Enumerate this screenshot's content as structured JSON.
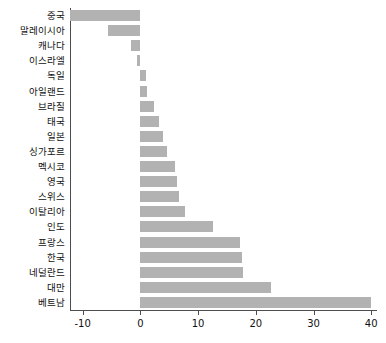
{
  "chart_data": {
    "type": "bar",
    "orientation": "horizontal",
    "title": "",
    "xlabel": "",
    "ylabel": "",
    "xlim": [
      -12.2,
      41.0
    ],
    "ylim": null,
    "grid": false,
    "legend": null,
    "bar_color": "#b2b2b2",
    "axis_color": "#4d4d4d",
    "xticks": [
      -10,
      0,
      10,
      20,
      30,
      40
    ],
    "xtick_labels": [
      "-10",
      "0",
      "10",
      "20",
      "30",
      "40"
    ],
    "categories": [
      "중국",
      "말레이시아",
      "캐나다",
      "이스라엘",
      "독일",
      "아일랜드",
      "브라질",
      "태국",
      "일본",
      "싱가포르",
      "멕시코",
      "영국",
      "스위스",
      "이탈리아",
      "인도",
      "프랑스",
      "한국",
      "네덜란드",
      "대만",
      "베트남"
    ],
    "values": [
      -12.2,
      -5.6,
      -1.6,
      -0.6,
      0.9,
      1.2,
      2.3,
      3.3,
      4.0,
      4.6,
      6.0,
      6.4,
      6.7,
      7.7,
      12.6,
      17.3,
      17.6,
      17.8,
      22.6,
      40.0
    ]
  }
}
